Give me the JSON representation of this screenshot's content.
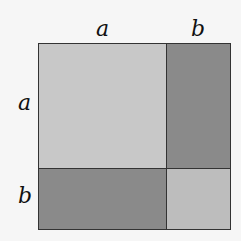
{
  "diagram": {
    "labels": {
      "top_a": "a",
      "top_b": "b",
      "left_a": "a",
      "left_b": "b"
    },
    "regions": [
      {
        "name": "a-squared",
        "color": "#c8c8c8"
      },
      {
        "name": "ab-top-right",
        "color": "#8a8a8a"
      },
      {
        "name": "ab-bottom-left",
        "color": "#8a8a8a"
      },
      {
        "name": "b-squared",
        "color": "#bdbdbd"
      }
    ]
  }
}
